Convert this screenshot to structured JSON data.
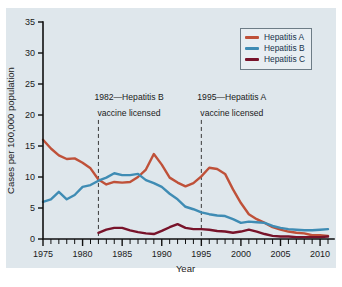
{
  "figure": {
    "background": "#ffffff",
    "panel_color": "#dfe7ec"
  },
  "chart_data": {
    "type": "line",
    "title": "",
    "xlabel": "Year",
    "ylabel": "Cases per 100,000 population",
    "xlim": [
      1975,
      2011
    ],
    "ylim": [
      0,
      35
    ],
    "ytick_labels": [
      "0",
      "5",
      "10",
      "15",
      "20",
      "25",
      "30",
      "35"
    ],
    "yticks": [
      0,
      5,
      10,
      15,
      20,
      25,
      30,
      35
    ],
    "xtick_labels": [
      "1975",
      "1980",
      "1985",
      "1990",
      "1995",
      "2000",
      "2005",
      "2010"
    ],
    "xticks": [
      1975,
      1980,
      1985,
      1990,
      1995,
      2000,
      2005,
      2010
    ],
    "minor_xtick_step": 1,
    "grid": false,
    "legend_position": "top-right",
    "x": [
      1975,
      1976,
      1977,
      1978,
      1979,
      1980,
      1981,
      1982,
      1983,
      1984,
      1985,
      1986,
      1987,
      1988,
      1989,
      1990,
      1991,
      1992,
      1993,
      1994,
      1995,
      1996,
      1997,
      1998,
      1999,
      2000,
      2001,
      2002,
      2003,
      2004,
      2005,
      2006,
      2007,
      2008,
      2009,
      2010,
      2011
    ],
    "series": [
      {
        "name": "Hepatitis A",
        "color": "#bf5139",
        "values": [
          16.0,
          14.6,
          13.5,
          12.9,
          13.0,
          12.3,
          11.4,
          9.6,
          8.8,
          9.2,
          9.1,
          9.2,
          10.0,
          11.2,
          13.7,
          12.0,
          9.9,
          9.1,
          8.5,
          9.0,
          10.1,
          11.5,
          11.3,
          10.5,
          8.0,
          5.8,
          4.0,
          3.2,
          2.6,
          1.9,
          1.5,
          1.2,
          1.0,
          0.9,
          0.6,
          0.6,
          0.5
        ]
      },
      {
        "name": "Hepatitis B",
        "color": "#3f8cb4",
        "values": [
          6.0,
          6.4,
          7.6,
          6.4,
          7.1,
          8.4,
          8.7,
          9.4,
          9.9,
          10.6,
          10.3,
          10.3,
          10.5,
          9.5,
          9.0,
          8.4,
          7.3,
          6.4,
          5.2,
          4.8,
          4.3,
          4.0,
          3.8,
          3.7,
          3.2,
          2.6,
          2.8,
          2.7,
          2.6,
          2.1,
          1.8,
          1.6,
          1.5,
          1.4,
          1.4,
          1.5,
          1.6
        ]
      },
      {
        "name": "Hepatitis C",
        "color": "#78132a",
        "values": [
          null,
          null,
          null,
          null,
          null,
          null,
          null,
          1.0,
          1.5,
          1.8,
          1.8,
          1.4,
          1.1,
          0.9,
          0.8,
          1.3,
          1.9,
          2.4,
          1.8,
          1.6,
          1.6,
          1.5,
          1.3,
          1.2,
          1.0,
          1.2,
          1.5,
          1.2,
          0.8,
          0.5,
          0.4,
          0.4,
          0.3,
          0.3,
          0.3,
          0.3,
          0.4
        ]
      }
    ],
    "annotations": [
      {
        "x": 1982,
        "line1": "1982—Hepatitis B",
        "line2": "vaccine licensed"
      },
      {
        "x": 1995,
        "line1": "1995—Hepatitis A",
        "line2": "vaccine licensed"
      }
    ]
  },
  "legend": {
    "items": [
      {
        "label": "Hepatitis A",
        "color": "#bf5139"
      },
      {
        "label": "Hepatitis B",
        "color": "#3f8cb4"
      },
      {
        "label": "Hepatitis C",
        "color": "#78132a"
      }
    ]
  }
}
